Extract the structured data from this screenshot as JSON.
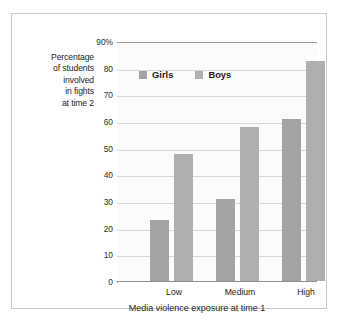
{
  "chart_data": {
    "type": "bar",
    "title": "",
    "categories": [
      "Low",
      "Medium",
      "High"
    ],
    "series": [
      {
        "name": "Girls",
        "values": [
          23,
          31,
          61
        ],
        "color": "#a3a3a3"
      },
      {
        "name": "Boys",
        "values": [
          48,
          58,
          83
        ],
        "color": "#afafaf"
      }
    ],
    "xlabel": "Media violence exposure at time 1",
    "ylabel": "Percentage of students involved in fights at time 2",
    "ylabel_lines": [
      "Percentage",
      "of students",
      "involved",
      "in fights",
      "at time 2"
    ],
    "ylim": [
      0,
      90
    ],
    "ytick_values": [
      0,
      10,
      20,
      30,
      40,
      50,
      60,
      70,
      80,
      90
    ],
    "ytick_labels": [
      "0",
      "10",
      "20",
      "30",
      "40",
      "50",
      "60",
      "70",
      "80",
      "90%"
    ],
    "grid": true,
    "legend_position": "inside-top-left",
    "legend": [
      "Girls",
      "Boys"
    ]
  },
  "axis": {
    "y_top_label": "90%",
    "y_labels": {
      "t0": "0",
      "t1": "10",
      "t2": "20",
      "t3": "30",
      "t4": "40",
      "t5": "50",
      "t6": "60",
      "t7": "70",
      "t8": "80",
      "t9": "90%"
    },
    "x_labels": {
      "c0": "Low",
      "c1": "Medium",
      "c2": "High"
    },
    "x_title": "Media violence exposure at time 1"
  },
  "ylabel_block": {
    "line1": "Percentage",
    "line2": "of students",
    "line3": "involved",
    "line4": "in fights",
    "line5": "at time 2"
  },
  "legend": {
    "girls_label": "Girls",
    "boys_label": "Boys"
  },
  "colors": {
    "girls": "#a3a3a3",
    "boys": "#afafaf",
    "frame": "#c9c9c9",
    "grid": "#d6d6d6",
    "axis": "#8f8f8f",
    "plot_background": "#fbfbfb"
  }
}
